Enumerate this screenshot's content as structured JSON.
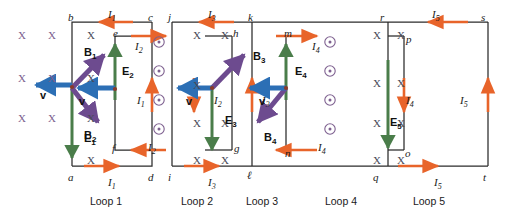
{
  "figure": {
    "type": "physics-circuit-diagram",
    "colors": {
      "wire": "#2b2b2b",
      "current_arrow": "#e8642a",
      "E_field_arrow": "#4a7d4a",
      "B_field_arrow": "#6d4b8f",
      "velocity_arrow": "#2c6fb5",
      "x_symbol": "#7d5f8f",
      "dot_symbol": "#7d5f8f",
      "text": "#1a1a1a"
    }
  },
  "loops": [
    {
      "name": "Loop 1",
      "corners": [
        "a",
        "b",
        "c",
        "d"
      ],
      "current": "I1",
      "bar_field": "E1",
      "inner_nodes": []
    },
    {
      "name": "Loop 2",
      "corners": [
        "e",
        "f"
      ],
      "current": "I2",
      "bar_field": "E2",
      "inner_nodes": [
        "e",
        "f"
      ]
    },
    {
      "name": "Loop 3",
      "corners": [
        "g",
        "h",
        "i",
        "j"
      ],
      "current": "I3",
      "bar_field": "E3",
      "inner_nodes": []
    },
    {
      "name": "Loop 4",
      "corners": [
        "k",
        "l",
        "m",
        "n"
      ],
      "current": "I4",
      "bar_field": "E4",
      "inner_nodes": [
        "m",
        "n"
      ]
    },
    {
      "name": "Loop 5",
      "corners": [
        "o",
        "p",
        "q",
        "r",
        "s",
        "t"
      ],
      "current": "I5",
      "bar_field": "E5",
      "inner_nodes": []
    }
  ],
  "node_labels": [
    {
      "id": "b",
      "text": "b",
      "x": 68,
      "y": 12
    },
    {
      "id": "c",
      "text": "c",
      "x": 148,
      "y": 12
    },
    {
      "id": "j",
      "text": "j",
      "x": 168,
      "y": 12
    },
    {
      "id": "k",
      "text": "k",
      "x": 248,
      "y": 12
    },
    {
      "id": "r",
      "text": "r",
      "x": 380,
      "y": 12
    },
    {
      "id": "s",
      "text": "s",
      "x": 481,
      "y": 12
    },
    {
      "id": "e",
      "text": "e",
      "x": 113,
      "y": 28
    },
    {
      "id": "h",
      "text": "h",
      "x": 233,
      "y": 28
    },
    {
      "id": "m",
      "text": "m",
      "x": 284,
      "y": 28
    },
    {
      "id": "p",
      "text": "p",
      "x": 406,
      "y": 34
    },
    {
      "id": "f",
      "text": "f",
      "x": 112,
      "y": 143
    },
    {
      "id": "g",
      "text": "g",
      "x": 234,
      "y": 143
    },
    {
      "id": "n",
      "text": "n",
      "x": 285,
      "y": 148
    },
    {
      "id": "o",
      "text": "o",
      "x": 405,
      "y": 148
    },
    {
      "id": "a",
      "text": "a",
      "x": 68,
      "y": 172
    },
    {
      "id": "d",
      "text": "d",
      "x": 148,
      "y": 172
    },
    {
      "id": "i",
      "text": "i",
      "x": 168,
      "y": 172
    },
    {
      "id": "l",
      "text": "ℓ",
      "x": 247,
      "y": 170
    },
    {
      "id": "q",
      "text": "q",
      "x": 373,
      "y": 172
    },
    {
      "id": "t",
      "text": "t",
      "x": 483,
      "y": 172
    }
  ],
  "current_labels": [
    {
      "id": "I1-top",
      "text": "I",
      "sub": "1",
      "x": 108,
      "y": 9
    },
    {
      "id": "I1-right",
      "text": "I",
      "sub": "1",
      "x": 137,
      "y": 95
    },
    {
      "id": "I1-bottom",
      "text": "I",
      "sub": "1",
      "x": 108,
      "y": 177
    },
    {
      "id": "I2-top",
      "text": "I",
      "sub": "2",
      "x": 135,
      "y": 41
    },
    {
      "id": "I2-mid",
      "text": "I",
      "sub": "2",
      "x": 214,
      "y": 95
    },
    {
      "id": "I2-bottom",
      "text": "I",
      "sub": "2",
      "x": 148,
      "y": 142
    },
    {
      "id": "I3-top",
      "text": "I",
      "sub": "3",
      "x": 208,
      "y": 9
    },
    {
      "id": "I3-right",
      "text": "I",
      "sub": "3",
      "x": 262,
      "y": 95
    },
    {
      "id": "I3-bottom",
      "text": "I",
      "sub": "3",
      "x": 208,
      "y": 177
    },
    {
      "id": "I4-top",
      "text": "I",
      "sub": "4",
      "x": 312,
      "y": 41
    },
    {
      "id": "I4-right",
      "text": "I",
      "sub": "4",
      "x": 406,
      "y": 95
    },
    {
      "id": "I4-bottom",
      "text": "I",
      "sub": "4",
      "x": 318,
      "y": 142
    },
    {
      "id": "I5-top",
      "text": "I",
      "sub": "5",
      "x": 432,
      "y": 9
    },
    {
      "id": "I5-right",
      "text": "I",
      "sub": "5",
      "x": 460,
      "y": 95
    },
    {
      "id": "I5-bottom",
      "text": "I",
      "sub": "5",
      "x": 434,
      "y": 177
    }
  ],
  "field_labels": [
    {
      "id": "E1",
      "letter": "E",
      "sub": "1",
      "x": 84,
      "y": 133
    },
    {
      "id": "E2",
      "letter": "E",
      "sub": "2",
      "x": 122,
      "y": 66
    },
    {
      "id": "E3",
      "letter": "E",
      "sub": "3",
      "x": 225,
      "y": 115
    },
    {
      "id": "E4",
      "letter": "E",
      "sub": "4",
      "x": 295,
      "y": 66
    },
    {
      "id": "E5",
      "letter": "E",
      "sub": "5",
      "x": 390,
      "y": 117
    },
    {
      "id": "B1",
      "letter": "B",
      "sub": "1",
      "x": 84,
      "y": 47
    },
    {
      "id": "B2",
      "letter": "B",
      "sub": "2",
      "x": 84,
      "y": 130
    },
    {
      "id": "B3",
      "letter": "B",
      "sub": "3",
      "x": 253,
      "y": 51
    },
    {
      "id": "B4",
      "letter": "B",
      "sub": "4",
      "x": 264,
      "y": 132
    },
    {
      "id": "v1",
      "letter": "v",
      "sub": "",
      "x": 40,
      "y": 90
    },
    {
      "id": "v2",
      "letter": "v",
      "sub": "",
      "x": 79,
      "y": 96
    },
    {
      "id": "v3",
      "letter": "v",
      "sub": "",
      "x": 186,
      "y": 96
    },
    {
      "id": "v4",
      "letter": "v",
      "sub": "",
      "x": 259,
      "y": 96
    }
  ],
  "loop_names": [
    {
      "text": "Loop 1",
      "x": 106,
      "y": 196
    },
    {
      "text": "Loop 2",
      "x": 197,
      "y": 196
    },
    {
      "text": "Loop 3",
      "x": 262,
      "y": 196
    },
    {
      "text": "Loop 4",
      "x": 341,
      "y": 196
    },
    {
      "text": "Loop 5",
      "x": 429,
      "y": 196
    }
  ],
  "x_symbols": [
    {
      "x": 18,
      "y": 30,
      "dark": false
    },
    {
      "x": 48,
      "y": 30,
      "dark": false
    },
    {
      "x": 18,
      "y": 73,
      "dark": false
    },
    {
      "x": 48,
      "y": 73,
      "dark": false
    },
    {
      "x": 18,
      "y": 113,
      "dark": false
    },
    {
      "x": 48,
      "y": 113,
      "dark": false
    },
    {
      "x": 87,
      "y": 30,
      "dark": true
    },
    {
      "x": 87,
      "y": 73,
      "dark": true
    },
    {
      "x": 87,
      "y": 113,
      "dark": true
    },
    {
      "x": 87,
      "y": 155,
      "dark": true
    },
    {
      "x": 193,
      "y": 30,
      "dark": true
    },
    {
      "x": 221,
      "y": 30,
      "dark": true
    },
    {
      "x": 193,
      "y": 80,
      "dark": true
    },
    {
      "x": 193,
      "y": 118,
      "dark": true
    },
    {
      "x": 221,
      "y": 118,
      "dark": true
    },
    {
      "x": 193,
      "y": 155,
      "dark": true
    },
    {
      "x": 221,
      "y": 155,
      "dark": true
    },
    {
      "x": 373,
      "y": 30,
      "dark": true
    },
    {
      "x": 397,
      "y": 30,
      "dark": true
    },
    {
      "x": 373,
      "y": 78,
      "dark": true
    },
    {
      "x": 397,
      "y": 78,
      "dark": true
    },
    {
      "x": 373,
      "y": 118,
      "dark": true
    },
    {
      "x": 397,
      "y": 118,
      "dark": true
    },
    {
      "x": 373,
      "y": 155,
      "dark": true
    },
    {
      "x": 397,
      "y": 155,
      "dark": true
    }
  ],
  "dot_symbols": [
    {
      "x": 159,
      "y": 42
    },
    {
      "x": 159,
      "y": 71
    },
    {
      "x": 159,
      "y": 100
    },
    {
      "x": 159,
      "y": 129
    },
    {
      "x": 330,
      "y": 42
    },
    {
      "x": 330,
      "y": 71
    },
    {
      "x": 330,
      "y": 100
    },
    {
      "x": 330,
      "y": 129
    }
  ]
}
